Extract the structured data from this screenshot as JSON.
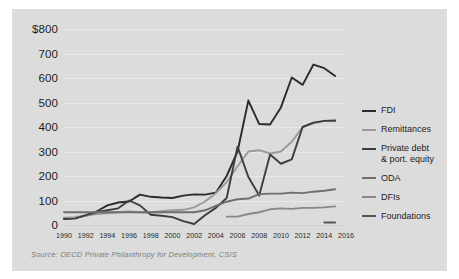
{
  "caption": "Source: OECD Private Philanthropy for Development, CSIS",
  "legend": [
    {
      "label": "FDI",
      "color": "#2b2b2b"
    },
    {
      "label": "Remittances",
      "color": "#9a9a9a"
    },
    {
      "label": "Private debt\n& port. equity",
      "color": "#3d3d3d"
    },
    {
      "label": "ODA",
      "color": "#6e6e6e"
    },
    {
      "label": "DFIs",
      "color": "#888888"
    },
    {
      "label": "Foundations",
      "color": "#555555"
    }
  ],
  "chart_data": {
    "type": "line",
    "title": "",
    "xlabel": "",
    "ylabel": "",
    "ylim": [
      0,
      800
    ],
    "xlim": [
      1990,
      2016
    ],
    "ytick_labels": [
      "$800",
      "700",
      "600",
      "500",
      "400",
      "300",
      "200",
      "100",
      "0"
    ],
    "ytick_values": [
      800,
      700,
      600,
      500,
      400,
      300,
      200,
      100,
      0
    ],
    "xtick_labels": [
      "1990",
      "1992",
      "1994",
      "1996",
      "1998",
      "2000",
      "2002",
      "2004",
      "2006",
      "2008",
      "2010",
      "2012",
      "2014",
      "2016"
    ],
    "xtick_values": [
      1990,
      1992,
      1994,
      1996,
      1998,
      2000,
      2002,
      2004,
      2006,
      2008,
      2010,
      2012,
      2014,
      2016
    ],
    "grid": true,
    "legend_position": "right",
    "series": [
      {
        "name": "FDI",
        "color": "#2b2b2b",
        "x": [
          1990,
          1991,
          1992,
          1993,
          1994,
          1995,
          1996,
          1997,
          1998,
          1999,
          2000,
          2001,
          2002,
          2003,
          2004,
          2005,
          2006,
          2007,
          2008,
          2009,
          2010,
          2011,
          2012,
          2013,
          2014,
          2015
        ],
        "values": [
          26,
          28,
          38,
          55,
          80,
          92,
          96,
          124,
          115,
          112,
          110,
          120,
          125,
          124,
          132,
          200,
          300,
          508,
          412,
          410,
          480,
          602,
          572,
          655,
          640,
          608
        ]
      },
      {
        "name": "Remittances",
        "color": "#9a9a9a",
        "x": [
          1990,
          1991,
          1992,
          1993,
          1994,
          1995,
          1996,
          1997,
          1998,
          1999,
          2000,
          2001,
          2002,
          2003,
          2004,
          2005,
          2006,
          2007,
          2008,
          2009,
          2010,
          2011,
          2012,
          2013,
          2014,
          2015
        ],
        "values": [
          30,
          32,
          38,
          45,
          48,
          52,
          55,
          52,
          50,
          56,
          60,
          62,
          72,
          96,
          130,
          175,
          240,
          300,
          305,
          292,
          300,
          340,
          400,
          415,
          425,
          430
        ]
      },
      {
        "name": "Private debt & port. equity",
        "color": "#3d3d3d",
        "x": [
          1990,
          1991,
          1992,
          1993,
          1994,
          1995,
          1996,
          1997,
          1998,
          1999,
          2000,
          2001,
          2002,
          2003,
          2004,
          2005,
          2006,
          2007,
          2008,
          2009,
          2010,
          2011,
          2012,
          2013,
          2014,
          2015
        ],
        "values": [
          24,
          26,
          40,
          52,
          60,
          68,
          100,
          80,
          42,
          38,
          32,
          16,
          4,
          40,
          70,
          110,
          320,
          196,
          120,
          288,
          250,
          268,
          400,
          418,
          425,
          425
        ]
      },
      {
        "name": "ODA",
        "color": "#6e6e6e",
        "x": [
          1990,
          1991,
          1992,
          1993,
          1994,
          1995,
          1996,
          1997,
          1998,
          1999,
          2000,
          2001,
          2002,
          2003,
          2004,
          2005,
          2006,
          2007,
          2008,
          2009,
          2010,
          2011,
          2012,
          2013,
          2014,
          2015
        ],
        "values": [
          52,
          52,
          52,
          52,
          52,
          52,
          52,
          52,
          52,
          52,
          52,
          52,
          52,
          60,
          78,
          95,
          105,
          108,
          126,
          128,
          128,
          132,
          130,
          136,
          140,
          146
        ]
      },
      {
        "name": "DFIs",
        "color": "#888888",
        "x": [
          2005,
          2006,
          2007,
          2008,
          2009,
          2010,
          2011,
          2012,
          2013,
          2014,
          2015
        ],
        "values": [
          34,
          34,
          45,
          52,
          64,
          68,
          66,
          70,
          70,
          72,
          76
        ]
      },
      {
        "name": "Foundations",
        "color": "#555555",
        "x": [
          2014,
          2015
        ],
        "values": [
          10,
          10
        ]
      }
    ]
  }
}
